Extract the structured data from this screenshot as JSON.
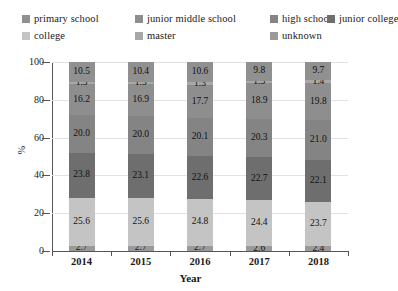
{
  "chart_data": {
    "type": "bar",
    "subtype": "stacked-bar-percent",
    "title": "",
    "xlabel": "Year",
    "ylabel": "%",
    "categories": [
      "2014",
      "2015",
      "2016",
      "2017",
      "2018"
    ],
    "ylim": [
      0,
      100
    ],
    "yticks": [
      0,
      20,
      40,
      60,
      80,
      100
    ],
    "grid": true,
    "legend_position": "top",
    "stack_order_bottom_to_top": [
      "unknown",
      "college",
      "junior college",
      "high school",
      "junior middle school",
      "master",
      "primary school"
    ],
    "series": [
      {
        "name": "unknown",
        "color": "#9a9a9a",
        "values": [
          2.7,
          2.7,
          2.7,
          2.6,
          2.4
        ]
      },
      {
        "name": "college",
        "color": "#c4c4c4",
        "values": [
          25.6,
          25.6,
          24.8,
          24.4,
          23.7
        ]
      },
      {
        "name": "junior college",
        "color": "#6e6e6e",
        "values": [
          23.8,
          23.1,
          22.6,
          22.7,
          22.1
        ]
      },
      {
        "name": "high school",
        "color": "#848484",
        "values": [
          20.0,
          20.0,
          20.1,
          20.3,
          21.0
        ]
      },
      {
        "name": "junior middle school",
        "color": "#8e8e8e",
        "values": [
          16.2,
          16.9,
          17.7,
          18.9,
          19.8
        ]
      },
      {
        "name": "master",
        "color": "#a8a8a8",
        "values": [
          1.3,
          1.3,
          1.3,
          1.3,
          1.4
        ]
      },
      {
        "name": "primary school",
        "color": "#909090",
        "values": [
          10.5,
          10.4,
          10.6,
          9.8,
          9.7
        ]
      }
    ]
  },
  "legend": {
    "rows": [
      [
        {
          "label": "primary school",
          "color": "#909090"
        },
        {
          "label": "junior middle school",
          "color": "#8e8e8e"
        },
        {
          "label": "high school",
          "color": "#848484"
        },
        {
          "label": "junior college",
          "color": "#6e6e6e"
        }
      ],
      [
        {
          "label": "college",
          "color": "#c4c4c4"
        },
        {
          "label": "master",
          "color": "#a8a8a8"
        },
        {
          "label": "unknown",
          "color": "#9a9a9a"
        }
      ]
    ]
  },
  "axes": {
    "y_title": "%",
    "x_title": "Year",
    "y_tick_labels": [
      "0",
      "20",
      "40",
      "60",
      "80",
      "100"
    ],
    "x_tick_labels": [
      "2014",
      "2015",
      "2016",
      "2017",
      "2018"
    ]
  }
}
